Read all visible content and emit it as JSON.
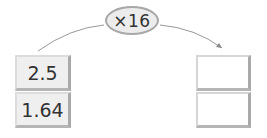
{
  "operation": {
    "label": "×16"
  },
  "left_column": {
    "values": [
      "2.5",
      "1.64"
    ]
  },
  "right_column": {
    "values": [
      "",
      ""
    ]
  },
  "colors": {
    "box_fill": "#efefef",
    "box_shadow": "#a9a9a9",
    "oval_fill": "#ececec",
    "oval_border": "#a8a8a8",
    "arc": "#888888"
  }
}
